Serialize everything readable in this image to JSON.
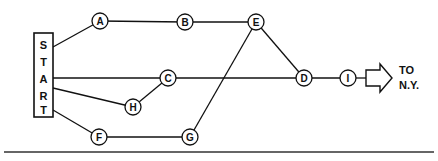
{
  "diagram": {
    "type": "network-graph",
    "start_box": {
      "label": "START",
      "letters": [
        "S",
        "T",
        "A",
        "R",
        "T"
      ],
      "x": 34,
      "y": 33,
      "width": 19,
      "height": 84
    },
    "nodes": [
      {
        "id": "A",
        "label": "A",
        "x": 100,
        "y": 21,
        "r": 8
      },
      {
        "id": "B",
        "label": "B",
        "x": 185,
        "y": 22,
        "r": 8
      },
      {
        "id": "E",
        "label": "E",
        "x": 256,
        "y": 22,
        "r": 8
      },
      {
        "id": "C",
        "label": "C",
        "x": 168,
        "y": 78,
        "r": 8
      },
      {
        "id": "D",
        "label": "D",
        "x": 304,
        "y": 78,
        "r": 8
      },
      {
        "id": "I",
        "label": "I",
        "x": 348,
        "y": 78,
        "r": 8
      },
      {
        "id": "H",
        "label": "H",
        "x": 133,
        "y": 107,
        "r": 8
      },
      {
        "id": "F",
        "label": "F",
        "x": 99,
        "y": 137,
        "r": 8
      },
      {
        "id": "G",
        "label": "G",
        "x": 190,
        "y": 137,
        "r": 8
      }
    ],
    "edges": [
      {
        "id": "start-a",
        "from": "START",
        "to": "A",
        "x1": 53,
        "y1": 47,
        "x2": 100,
        "y2": 21
      },
      {
        "id": "a-b",
        "from": "A",
        "to": "B",
        "x1": 100,
        "y1": 21,
        "x2": 185,
        "y2": 22
      },
      {
        "id": "b-e",
        "from": "B",
        "to": "E",
        "x1": 185,
        "y1": 22,
        "x2": 256,
        "y2": 22
      },
      {
        "id": "e-d",
        "from": "E",
        "to": "D",
        "x1": 256,
        "y1": 22,
        "x2": 304,
        "y2": 78
      },
      {
        "id": "start-c",
        "from": "START",
        "to": "C",
        "x1": 53,
        "y1": 78,
        "x2": 168,
        "y2": 78
      },
      {
        "id": "c-d",
        "from": "C",
        "to": "D",
        "x1": 168,
        "y1": 78,
        "x2": 304,
        "y2": 78
      },
      {
        "id": "d-i",
        "from": "D",
        "to": "I",
        "x1": 304,
        "y1": 78,
        "x2": 348,
        "y2": 78
      },
      {
        "id": "start-h",
        "from": "START",
        "to": "H",
        "x1": 53,
        "y1": 88,
        "x2": 133,
        "y2": 107
      },
      {
        "id": "h-c",
        "from": "H",
        "to": "C",
        "x1": 133,
        "y1": 107,
        "x2": 168,
        "y2": 78
      },
      {
        "id": "start-f",
        "from": "START",
        "to": "F",
        "x1": 53,
        "y1": 110,
        "x2": 99,
        "y2": 137
      },
      {
        "id": "f-g",
        "from": "F",
        "to": "G",
        "x1": 99,
        "y1": 137,
        "x2": 190,
        "y2": 137
      },
      {
        "id": "g-e",
        "from": "G",
        "to": "E",
        "x1": 190,
        "y1": 137,
        "x2": 256,
        "y2": 22
      }
    ]
  },
  "destination": {
    "arrow_icon": "block-arrow-right-icon",
    "line1": "TO",
    "line2": "N.Y."
  },
  "colors": {
    "stroke": "#111111",
    "background": "#ffffff",
    "rule": "#333333"
  }
}
